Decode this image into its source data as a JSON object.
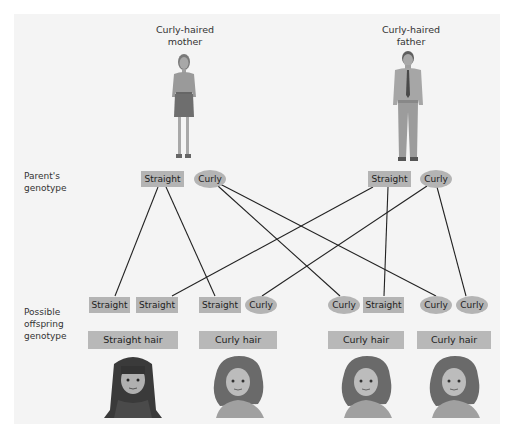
{
  "parents": {
    "mother": {
      "title_line1": "Curly-haired",
      "title_line2": "mother",
      "genotype": [
        "Straight",
        "Curly"
      ]
    },
    "father": {
      "title_line1": "Curly-haired",
      "title_line2": "father",
      "genotype": [
        "Straight",
        "Curly"
      ]
    }
  },
  "row_labels": {
    "parent_genotype": [
      "Parent's",
      "genotype"
    ],
    "offspring_genotype": [
      "Possible",
      "offspring",
      "genotype"
    ]
  },
  "offspring": [
    {
      "alleles": [
        "Straight",
        "Straight"
      ],
      "phenotype": "Straight hair"
    },
    {
      "alleles": [
        "Straight",
        "Curly"
      ],
      "phenotype": "Curly hair"
    },
    {
      "alleles": [
        "Curly",
        "Straight"
      ],
      "phenotype": "Curly hair"
    },
    {
      "alleles": [
        "Curly",
        "Curly"
      ],
      "phenotype": "Curly hair"
    }
  ],
  "colors": {
    "panel": "#f4f4f4",
    "box": "#b4b4b4",
    "line": "#222222"
  }
}
